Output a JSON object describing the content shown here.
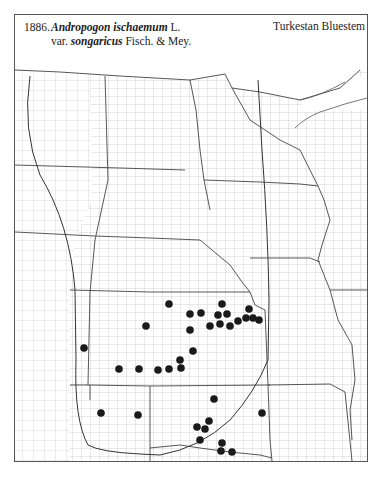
{
  "header": {
    "number": "1886.",
    "genus_species": "Andropogon ischaemum",
    "author1": "L.",
    "var_prefix": "var.",
    "variety": "songaricus",
    "author2": "Fisch. & Mey.",
    "common_name": "Turkestan Bluestem"
  },
  "map": {
    "region": "Great Plains (ND, SD, NE, KS, OK, MN, IA, MO, WI, IL, AR)",
    "colors": {
      "ink": "#222222",
      "county_line": "#9a9a9a",
      "state_line": "#444444",
      "dot": "#1a1a1a"
    },
    "occurrence_dots": [
      [
        169,
        304
      ],
      [
        146,
        326
      ],
      [
        190,
        314
      ],
      [
        190,
        330
      ],
      [
        193,
        351
      ],
      [
        180,
        360
      ],
      [
        119,
        369
      ],
      [
        139,
        369
      ],
      [
        158,
        370
      ],
      [
        169,
        369
      ],
      [
        181,
        368
      ],
      [
        84,
        348
      ],
      [
        201,
        313
      ],
      [
        222,
        304
      ],
      [
        218,
        315
      ],
      [
        227,
        314
      ],
      [
        210,
        326
      ],
      [
        220,
        324
      ],
      [
        230,
        326
      ],
      [
        238,
        321
      ],
      [
        246,
        318
      ],
      [
        249,
        309
      ],
      [
        253,
        318
      ],
      [
        259,
        320
      ],
      [
        101,
        413
      ],
      [
        138,
        415
      ],
      [
        214,
        399
      ],
      [
        262,
        413
      ],
      [
        209,
        421
      ],
      [
        197,
        427
      ],
      [
        205,
        429
      ],
      [
        200,
        440
      ],
      [
        222,
        443
      ],
      [
        221,
        451
      ],
      [
        232,
        452
      ]
    ]
  }
}
